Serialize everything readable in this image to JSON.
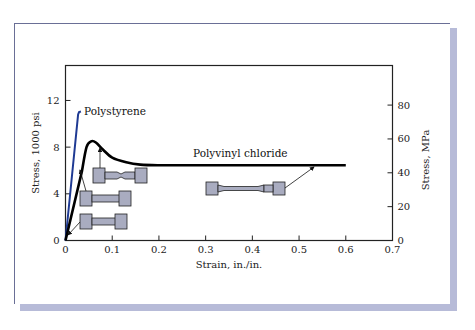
{
  "chart_data": {
    "type": "line",
    "title": "",
    "xlabel": "Strain, in./in.",
    "ylabel": "Stress, 1000 psi",
    "ylabel_right": "Stress, MPa",
    "xlim": [
      0,
      0.7
    ],
    "ylim": [
      0,
      15
    ],
    "ylim_right_mpa": [
      0,
      103
    ],
    "grid": false,
    "legend": "inline labels",
    "x_ticks": [
      0,
      0.1,
      0.2,
      0.3,
      0.4,
      0.5,
      0.6,
      0.7
    ],
    "x_tick_labels": [
      "0",
      "0.1",
      "0.2",
      "0.3",
      "0.4",
      "0.5",
      "0.6",
      "0.7"
    ],
    "y_ticks": [
      0,
      4,
      8,
      12
    ],
    "y_tick_labels": [
      "0",
      "4",
      "8",
      "12"
    ],
    "y_right_ticks_mpa": [
      0,
      20,
      40,
      60,
      80
    ],
    "y_right_tick_labels": [
      "0",
      "20",
      "40",
      "60",
      "80"
    ],
    "series": [
      {
        "name": "Polystyrene",
        "color": "#1f3a93",
        "x": [
          0,
          0.027,
          0.029,
          0.033
        ],
        "y": [
          0,
          10.8,
          11.0,
          11.05
        ]
      },
      {
        "name": "Polyvinyl chloride",
        "color": "#000000",
        "x": [
          0,
          0.035,
          0.045,
          0.055,
          0.065,
          0.08,
          0.1,
          0.13,
          0.16,
          0.2,
          0.3,
          0.4,
          0.5,
          0.6
        ],
        "y": [
          0,
          5.9,
          8.0,
          8.5,
          8.4,
          7.8,
          7.1,
          6.7,
          6.5,
          6.45,
          6.45,
          6.45,
          6.45,
          6.45
        ]
      }
    ],
    "annotations": [
      {
        "text": "Polystyrene",
        "x": 0.035,
        "y": 11.0
      },
      {
        "text": "Polyvinyl chloride",
        "x": 0.28,
        "y": 7.2
      },
      {
        "text": "specimen: initial (elastic)",
        "points_to": [
          0.002,
          0.3
        ]
      },
      {
        "text": "specimen: onset of necking",
        "points_to": [
          0.032,
          6.1
        ]
      },
      {
        "text": "specimen: necked at yield peak",
        "points_to": [
          0.075,
          8.0
        ]
      },
      {
        "text": "specimen: cold-drawn neck",
        "points_to": [
          0.535,
          6.45
        ]
      }
    ]
  },
  "labels": {
    "polystyrene": "Polystyrene",
    "pvc": "Polyvinyl chloride",
    "xlabel": "Strain, in./in.",
    "ylabel": "Stress, 1000 psi",
    "ylabel_right": "Stress, MPa"
  },
  "colors": {
    "frame_border": "#6a6f96",
    "frame_shadow": "#b7bbd8",
    "specimen_fill": "#a9acc0",
    "polystyrene": "#1f3a93",
    "pvc": "#000000"
  }
}
